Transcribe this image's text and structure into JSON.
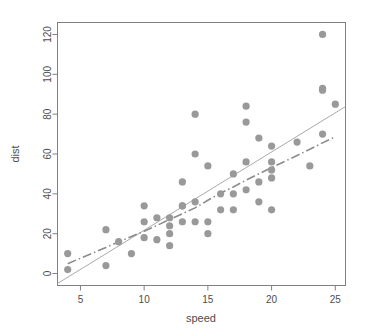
{
  "chart_data": {
    "type": "scatter",
    "title": "",
    "subtitle": "",
    "xlabel": "speed",
    "ylabel": "dist",
    "xlim": [
      3.2,
      25.8
    ],
    "ylim": [
      -6,
      126
    ],
    "xticks": [
      5,
      10,
      15,
      20,
      25
    ],
    "yticks": [
      0,
      20,
      40,
      60,
      80,
      100,
      120
    ],
    "xtick_labels": [
      "5",
      "10",
      "15",
      "20",
      "25"
    ],
    "ytick_labels": [
      "0",
      "20",
      "40",
      "60",
      "80",
      "100",
      "120"
    ],
    "grid": false,
    "legend": null,
    "legend_position": "none",
    "point_color": "#999999",
    "point_marker": "filled-circle",
    "point_radius_px": 3.6,
    "axis_color": "#808080",
    "x": [
      4,
      4,
      7,
      7,
      8,
      9,
      10,
      10,
      10,
      11,
      11,
      12,
      12,
      12,
      12,
      13,
      13,
      13,
      13,
      14,
      14,
      14,
      14,
      15,
      15,
      15,
      16,
      16,
      17,
      17,
      17,
      18,
      18,
      18,
      18,
      19,
      19,
      19,
      20,
      20,
      20,
      20,
      20,
      22,
      23,
      24,
      24,
      24,
      24,
      25
    ],
    "y": [
      2,
      10,
      4,
      22,
      16,
      10,
      18,
      26,
      34,
      17,
      28,
      14,
      20,
      24,
      28,
      26,
      34,
      34,
      46,
      26,
      36,
      60,
      80,
      20,
      26,
      54,
      32,
      40,
      32,
      40,
      50,
      42,
      56,
      76,
      84,
      36,
      46,
      68,
      32,
      48,
      52,
      56,
      64,
      66,
      54,
      70,
      92,
      93,
      120,
      85
    ],
    "series": [
      {
        "name": "cars",
        "type": "scatter",
        "color": "#999999"
      },
      {
        "name": "regression-line",
        "type": "line",
        "style": "solid",
        "color": "#aaaaaa",
        "intercept": -17.58,
        "slope": 3.93,
        "x_range": [
          3.2,
          25.8
        ]
      },
      {
        "name": "lowess-smoother",
        "type": "line",
        "style": "dash-dot",
        "color": "#8c8c8c",
        "points": [
          [
            4,
            4.965
          ],
          [
            4,
            4.965
          ],
          [
            7,
            13.124
          ],
          [
            7,
            13.124
          ],
          [
            8,
            15.858
          ],
          [
            9,
            18.579
          ],
          [
            10,
            21.28
          ],
          [
            10,
            21.28
          ],
          [
            10,
            21.28
          ],
          [
            11,
            24.129
          ],
          [
            11,
            24.129
          ],
          [
            12,
            27.119
          ],
          [
            12,
            27.119
          ],
          [
            12,
            27.119
          ],
          [
            12,
            27.119
          ],
          [
            13,
            30.027
          ],
          [
            13,
            30.027
          ],
          [
            13,
            30.027
          ],
          [
            13,
            30.027
          ],
          [
            14,
            32.963
          ],
          [
            14,
            32.963
          ],
          [
            14,
            32.963
          ],
          [
            14,
            32.963
          ],
          [
            15,
            36.757
          ],
          [
            15,
            36.757
          ],
          [
            15,
            36.757
          ],
          [
            16,
            40.435
          ],
          [
            16,
            40.435
          ],
          [
            17,
            43.463
          ],
          [
            17,
            43.463
          ],
          [
            17,
            43.463
          ],
          [
            18,
            46.88
          ],
          [
            18,
            46.88
          ],
          [
            18,
            46.88
          ],
          [
            18,
            46.88
          ],
          [
            19,
            50.043
          ],
          [
            19,
            50.043
          ],
          [
            19,
            50.043
          ],
          [
            20,
            53.196
          ],
          [
            20,
            53.196
          ],
          [
            20,
            53.196
          ],
          [
            20,
            53.196
          ],
          [
            20,
            53.196
          ],
          [
            22,
            59.236
          ],
          [
            23,
            62.356
          ],
          [
            24,
            65.588
          ],
          [
            24,
            65.588
          ],
          [
            24,
            65.588
          ],
          [
            24,
            65.588
          ],
          [
            25,
            68.731
          ]
        ]
      }
    ]
  },
  "axes": {
    "x_label": "speed",
    "y_label": "dist"
  }
}
